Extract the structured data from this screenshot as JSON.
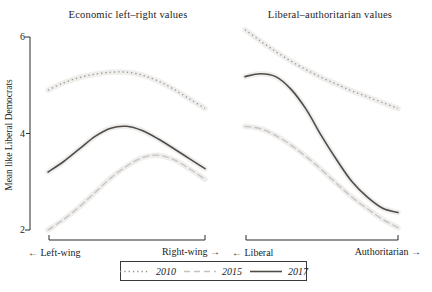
{
  "chart_data": {
    "type": "line",
    "ylabel": "Mean like Liberal Democrats",
    "ylim": [
      2,
      6
    ],
    "yticks": [
      "6",
      "4",
      "2"
    ],
    "grid": false,
    "legend_position": "bottom-center",
    "legend": [
      {
        "label": "2010",
        "style": "dotted",
        "color": "#9e988e"
      },
      {
        "label": "2015",
        "style": "dashed",
        "color": "#c6c3be"
      },
      {
        "label": "2017",
        "style": "solid",
        "color": "#504d49"
      }
    ],
    "band_color": "#b6b3ae",
    "axis_color": "#2b2b2b",
    "panels": [
      {
        "title": "Economic left–right values",
        "x_left_label": "← Left-wing",
        "x_right_label": "Right-wing →",
        "series": [
          {
            "name": "2010",
            "values": [
              4.9,
              5.05,
              5.16,
              5.23,
              5.27,
              5.27,
              5.21,
              5.09,
              4.92,
              4.72,
              4.52
            ]
          },
          {
            "name": "2015",
            "values": [
              2.0,
              2.22,
              2.48,
              2.78,
              3.08,
              3.32,
              3.5,
              3.55,
              3.46,
              3.27,
              3.05
            ]
          },
          {
            "name": "2017",
            "values": [
              3.2,
              3.42,
              3.68,
              3.94,
              4.11,
              4.15,
              4.06,
              3.89,
              3.69,
              3.48,
              3.27
            ]
          }
        ]
      },
      {
        "title": "Liberal–authoritarian values",
        "x_left_label": "← Liberal",
        "x_right_label": "Authoritarian →",
        "series": [
          {
            "name": "2010",
            "values": [
              6.15,
              5.92,
              5.7,
              5.5,
              5.32,
              5.16,
              5.02,
              4.88,
              4.76,
              4.64,
              4.52
            ]
          },
          {
            "name": "2015",
            "values": [
              4.15,
              4.1,
              3.96,
              3.76,
              3.52,
              3.25,
              2.96,
              2.68,
              2.44,
              2.22,
              2.05
            ]
          },
          {
            "name": "2017",
            "values": [
              5.18,
              5.24,
              5.18,
              4.92,
              4.5,
              3.95,
              3.45,
              3.0,
              2.68,
              2.45,
              2.36
            ]
          }
        ]
      }
    ]
  }
}
